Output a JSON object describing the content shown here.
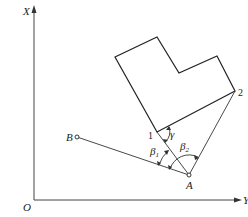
{
  "axes": {
    "x_label": "X",
    "y_label": "Y",
    "origin_label": "O"
  },
  "points": {
    "A": "A",
    "B": "B",
    "p1": "1",
    "p2": "2"
  },
  "angles": {
    "gamma": "γ",
    "beta1": "β",
    "beta1_sub": "1",
    "beta2": "β",
    "beta2_sub": "2"
  },
  "colors": {
    "stroke": "#222222",
    "background": "#ffffff"
  }
}
